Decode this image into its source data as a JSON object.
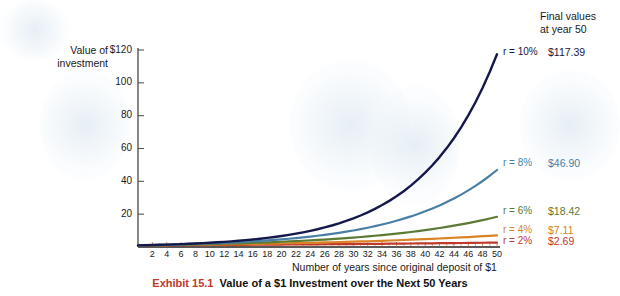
{
  "axes": {
    "y_title": "Value of\ninvestment",
    "x_title": "Number of years since original deposit of $1",
    "y_ticks": [
      "$120",
      "100",
      "80",
      "60",
      "40",
      "20"
    ],
    "x_ticks": [
      "2",
      "4",
      "6",
      "8",
      "10",
      "12",
      "14",
      "16",
      "18",
      "20",
      "22",
      "24",
      "26",
      "28",
      "30",
      "32",
      "34",
      "36",
      "38",
      "40",
      "42",
      "44",
      "46",
      "48",
      "50"
    ]
  },
  "legend": {
    "heading": "Final values\nat year 50",
    "entries": [
      {
        "label": "r = 10%",
        "value": "$117.39",
        "color": "#15184a"
      },
      {
        "label": "r = 8%",
        "value": "$46.90",
        "color": "#4a7fa5"
      },
      {
        "label": "r = 6%",
        "value": "$18.42",
        "color": "#5b7a34"
      },
      {
        "label": "r = 4%",
        "value": "$7.11",
        "color": "#d98324"
      },
      {
        "label": "r = 2%",
        "value": "$2.69",
        "color": "#c0392b"
      }
    ]
  },
  "caption": {
    "exhibit": "Exhibit 15.1",
    "text": "Value of a $1 Investment over the Next 50 Years"
  },
  "colors": {
    "background": "#ffffff",
    "axis": "#555555",
    "text": "#1a1a1a",
    "exhibit_red": "#c0392b"
  },
  "chart_data": {
    "type": "line",
    "title": "Value of a $1 Investment over the Next 50 Years",
    "xlabel": "Number of years since original deposit of $1",
    "ylabel": "Value of investment",
    "xlim": [
      0,
      50
    ],
    "ylim": [
      0,
      120
    ],
    "xticks": [
      2,
      4,
      6,
      8,
      10,
      12,
      14,
      16,
      18,
      20,
      22,
      24,
      26,
      28,
      30,
      32,
      34,
      36,
      38,
      40,
      42,
      44,
      46,
      48,
      50
    ],
    "yticks": [
      0,
      20,
      40,
      60,
      80,
      100,
      120
    ],
    "grid": false,
    "legend_position": "right-of-plot-at-line-ends",
    "x": [
      0,
      1,
      2,
      3,
      4,
      5,
      6,
      7,
      8,
      9,
      10,
      11,
      12,
      13,
      14,
      15,
      16,
      17,
      18,
      19,
      20,
      21,
      22,
      23,
      24,
      25,
      26,
      27,
      28,
      29,
      30,
      31,
      32,
      33,
      34,
      35,
      36,
      37,
      38,
      39,
      40,
      41,
      42,
      43,
      44,
      45,
      46,
      47,
      48,
      49,
      50
    ],
    "series": [
      {
        "name": "r = 10%",
        "rate": 0.1,
        "color": "#15184a",
        "final_value": 117.39,
        "values": [
          1.0,
          1.1,
          1.21,
          1.33,
          1.46,
          1.61,
          1.77,
          1.95,
          2.14,
          2.36,
          2.59,
          2.85,
          3.14,
          3.45,
          3.8,
          4.18,
          4.59,
          5.05,
          5.56,
          6.12,
          6.73,
          7.4,
          8.14,
          8.95,
          9.85,
          10.83,
          11.92,
          13.11,
          14.42,
          15.86,
          17.45,
          19.19,
          21.11,
          23.23,
          25.55,
          28.1,
          30.91,
          34.0,
          37.4,
          41.14,
          45.26,
          49.79,
          54.76,
          60.24,
          66.26,
          72.89,
          80.18,
          88.2,
          97.02,
          106.72,
          117.39
        ]
      },
      {
        "name": "r = 8%",
        "rate": 0.08,
        "color": "#4a7fa5",
        "final_value": 46.9,
        "values": [
          1.0,
          1.08,
          1.17,
          1.26,
          1.36,
          1.47,
          1.59,
          1.71,
          1.85,
          2.0,
          2.16,
          2.33,
          2.52,
          2.72,
          2.94,
          3.17,
          3.43,
          3.7,
          4.0,
          4.32,
          4.66,
          5.03,
          5.44,
          5.87,
          6.34,
          6.85,
          7.4,
          7.99,
          8.63,
          9.32,
          10.06,
          10.87,
          11.74,
          12.68,
          13.69,
          14.79,
          15.97,
          17.25,
          18.63,
          20.12,
          21.72,
          23.46,
          25.34,
          27.37,
          29.56,
          31.92,
          34.47,
          37.23,
          40.21,
          43.43,
          46.9
        ]
      },
      {
        "name": "r = 6%",
        "rate": 0.06,
        "color": "#5b7a34",
        "final_value": 18.42,
        "values": [
          1.0,
          1.06,
          1.12,
          1.19,
          1.26,
          1.34,
          1.42,
          1.5,
          1.59,
          1.69,
          1.79,
          1.9,
          2.01,
          2.13,
          2.26,
          2.4,
          2.54,
          2.69,
          2.85,
          3.03,
          3.21,
          3.4,
          3.6,
          3.82,
          4.05,
          4.29,
          4.55,
          4.82,
          5.11,
          5.42,
          5.74,
          6.09,
          6.45,
          6.84,
          7.25,
          7.69,
          8.15,
          8.64,
          9.15,
          9.7,
          10.29,
          10.9,
          11.56,
          12.25,
          12.99,
          13.76,
          14.59,
          15.47,
          16.39,
          17.38,
          18.42
        ]
      },
      {
        "name": "r = 4%",
        "rate": 0.04,
        "color": "#d98324",
        "final_value": 7.11,
        "values": [
          1.0,
          1.04,
          1.08,
          1.12,
          1.17,
          1.22,
          1.27,
          1.32,
          1.37,
          1.42,
          1.48,
          1.54,
          1.6,
          1.67,
          1.73,
          1.8,
          1.87,
          1.95,
          2.03,
          2.11,
          2.19,
          2.28,
          2.37,
          2.46,
          2.56,
          2.67,
          2.77,
          2.88,
          3.0,
          3.12,
          3.24,
          3.37,
          3.51,
          3.65,
          3.79,
          3.95,
          4.1,
          4.27,
          4.44,
          4.62,
          4.8,
          4.99,
          5.19,
          5.4,
          5.62,
          5.84,
          6.07,
          6.32,
          6.57,
          6.83,
          7.11
        ]
      },
      {
        "name": "r = 2%",
        "rate": 0.02,
        "color": "#c0392b",
        "final_value": 2.69,
        "values": [
          1.0,
          1.02,
          1.04,
          1.06,
          1.08,
          1.1,
          1.13,
          1.15,
          1.17,
          1.2,
          1.22,
          1.24,
          1.27,
          1.29,
          1.32,
          1.35,
          1.37,
          1.4,
          1.43,
          1.46,
          1.49,
          1.52,
          1.55,
          1.58,
          1.61,
          1.64,
          1.67,
          1.71,
          1.74,
          1.78,
          1.81,
          1.85,
          1.88,
          1.92,
          1.96,
          2.0,
          2.04,
          2.08,
          2.12,
          2.16,
          2.21,
          2.25,
          2.3,
          2.34,
          2.39,
          2.44,
          2.49,
          2.53,
          2.59,
          2.64,
          2.69
        ]
      }
    ]
  }
}
